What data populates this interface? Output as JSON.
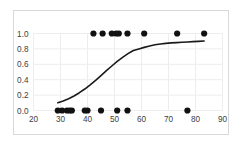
{
  "chart_data": {
    "type": "scatter",
    "title": "",
    "subtitle": "",
    "xlabel": "",
    "ylabel": "",
    "xlim": [
      20,
      90
    ],
    "ylim": [
      0.0,
      1.0
    ],
    "xticks": [
      20,
      30,
      40,
      50,
      60,
      70,
      80,
      90
    ],
    "xtick_labels": [
      "20",
      "30",
      "40",
      "50",
      "60",
      "70",
      "80",
      "90"
    ],
    "yticks": [
      0.0,
      0.2,
      0.4,
      0.6,
      0.8,
      1.0
    ],
    "ytick_labels": [
      "0.0",
      "0.2",
      "0.4",
      "0.6",
      "0.8",
      "1.0"
    ],
    "grid": true,
    "grid_color": "#ededed",
    "legend": null,
    "legend_position": "none",
    "marker_color": "#111111",
    "marker_size": 3.1,
    "line_color": "#1a1a1a",
    "line_width": 1.6,
    "frame_color": "#d9d9d9",
    "series": [
      {
        "name": "observations",
        "type": "scatter",
        "points": [
          [
            29.0,
            0.0
          ],
          [
            30.6,
            0.0
          ],
          [
            32.4,
            0.0
          ],
          [
            33.4,
            0.0
          ],
          [
            34.2,
            0.0
          ],
          [
            39.0,
            0.0
          ],
          [
            40.0,
            0.0
          ],
          [
            45.0,
            0.0
          ],
          [
            51.0,
            0.0
          ],
          [
            54.8,
            0.0
          ],
          [
            77.0,
            0.0
          ],
          [
            42.2,
            1.0
          ],
          [
            45.6,
            1.0
          ],
          [
            49.0,
            1.0
          ],
          [
            50.6,
            1.0
          ],
          [
            51.6,
            1.0
          ],
          [
            54.8,
            1.0
          ],
          [
            61.0,
            1.0
          ],
          [
            73.2,
            1.0
          ],
          [
            83.2,
            1.0
          ]
        ]
      },
      {
        "name": "fitted-logistic-curve",
        "type": "line",
        "points": [
          [
            29.0,
            0.1
          ],
          [
            31.0,
            0.124
          ],
          [
            33.0,
            0.153
          ],
          [
            35.0,
            0.189
          ],
          [
            37.0,
            0.231
          ],
          [
            39.0,
            0.279
          ],
          [
            41.0,
            0.333
          ],
          [
            43.0,
            0.392
          ],
          [
            45.0,
            0.454
          ],
          [
            47.0,
            0.517
          ],
          [
            49.0,
            0.578
          ],
          [
            51.0,
            0.637
          ],
          [
            53.0,
            0.69
          ],
          [
            55.0,
            0.738
          ],
          [
            57.0,
            0.78
          ],
          [
            59.0,
            0.8
          ],
          [
            61.0,
            0.82
          ],
          [
            63.0,
            0.838
          ],
          [
            65.0,
            0.853
          ],
          [
            67.0,
            0.864
          ],
          [
            69.0,
            0.872
          ],
          [
            71.0,
            0.878
          ],
          [
            73.0,
            0.882
          ],
          [
            75.0,
            0.886
          ],
          [
            77.0,
            0.89
          ],
          [
            79.0,
            0.894
          ],
          [
            81.0,
            0.898
          ],
          [
            83.2,
            0.903
          ]
        ]
      }
    ]
  }
}
